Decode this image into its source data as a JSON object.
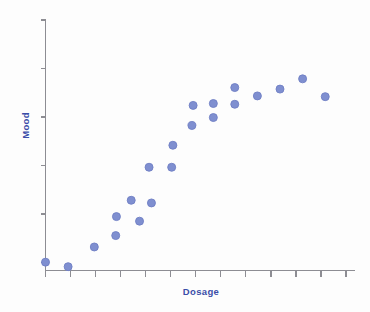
{
  "chart_data": {
    "type": "scatter",
    "title": "",
    "xlabel": "Dosage",
    "ylabel": "Mood",
    "grid": false,
    "legend": null,
    "xlim": [
      0,
      13
    ],
    "ylim": [
      0,
      6.6
    ],
    "x_tick_count": 13,
    "y_tick_count": 6,
    "x_tick_labels": [],
    "y_tick_labels": [],
    "marker": {
      "shape": "circle",
      "fill": "#7f8fd0",
      "edge": "#6f7fc4",
      "size_px": 8
    },
    "axis_color": "#8d8d93",
    "label_color": "#3b4da8",
    "background": "#fdfdfd",
    "point_count": 20,
    "points": [
      {
        "x": 0.0,
        "y": 0.22
      },
      {
        "x": 0.95,
        "y": 0.1
      },
      {
        "x": 2.05,
        "y": 0.62
      },
      {
        "x": 2.95,
        "y": 0.92
      },
      {
        "x": 2.98,
        "y": 1.42
      },
      {
        "x": 3.95,
        "y": 1.3
      },
      {
        "x": 3.6,
        "y": 1.85
      },
      {
        "x": 4.45,
        "y": 1.78
      },
      {
        "x": 4.35,
        "y": 2.72
      },
      {
        "x": 5.3,
        "y": 2.72
      },
      {
        "x": 5.35,
        "y": 3.3
      },
      {
        "x": 6.15,
        "y": 3.82
      },
      {
        "x": 6.2,
        "y": 4.35
      },
      {
        "x": 7.05,
        "y": 4.03
      },
      {
        "x": 7.05,
        "y": 4.4
      },
      {
        "x": 7.95,
        "y": 4.38
      },
      {
        "x": 7.95,
        "y": 4.82
      },
      {
        "x": 8.9,
        "y": 4.6
      },
      {
        "x": 9.85,
        "y": 4.78
      },
      {
        "x": 10.8,
        "y": 5.05
      },
      {
        "x": 11.75,
        "y": 4.58
      }
    ]
  }
}
